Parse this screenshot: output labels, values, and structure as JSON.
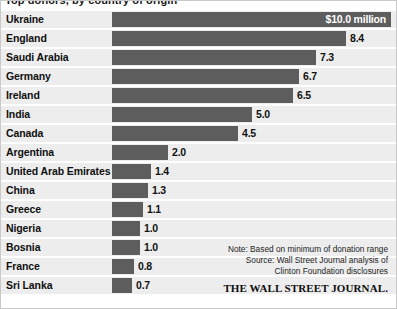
{
  "title": "Top donors, by country of origin",
  "chart_data": {
    "type": "bar",
    "orientation": "horizontal",
    "title": "Top donors, by country of origin",
    "xlabel": "",
    "ylabel": "",
    "unit": "$ millions",
    "grid": false,
    "legend": false,
    "xlim": [
      0,
      10
    ],
    "categories": [
      "Ukraine",
      "England",
      "Saudi Arabia",
      "Germany",
      "Ireland",
      "India",
      "Canada",
      "Argentina",
      "United Arab Emirates",
      "China",
      "Greece",
      "Nigeria",
      "Bosnia",
      "France",
      "Sri Lanka"
    ],
    "values": [
      10.0,
      8.4,
      7.3,
      6.7,
      6.5,
      5.0,
      4.5,
      2.0,
      1.4,
      1.3,
      1.1,
      1.0,
      1.0,
      0.8,
      0.7
    ],
    "value_labels": [
      "$10.0 million",
      "8.4",
      "7.3",
      "6.7",
      "6.5",
      "5.0",
      "4.5",
      "2.0",
      "1.4",
      "1.3",
      "1.1",
      "1.0",
      "1.0",
      "0.8",
      "0.7"
    ],
    "annotations": [
      "Note: Based on minimum of donation range",
      "Source: Wall Street Journal analysis of",
      "Clinton Foundation disclosures"
    ]
  },
  "footnote": {
    "note": "Note: Based on minimum of donation range",
    "source_line1": "Source: Wall Street Journal analysis of",
    "source_line2": "Clinton Foundation disclosures",
    "logo": "THE WALL STREET JOURNAL."
  },
  "colors": {
    "bar": "#5d5d5d",
    "row_band": "#ededed",
    "background": "#ffffff",
    "text": "#101010",
    "value_inside": "#ffffff"
  }
}
